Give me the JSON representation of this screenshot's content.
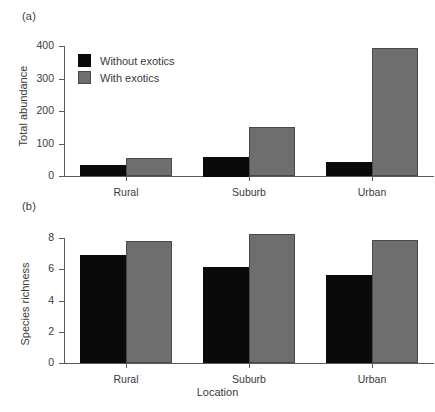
{
  "figure": {
    "panel_a_label": "(a)",
    "panel_b_label": "(b)"
  },
  "legend": {
    "position": "inside-top-left",
    "entries": [
      {
        "label": "Without exotics",
        "color": "#0a0a0a",
        "key": "without_exotics"
      },
      {
        "label": "With exotics",
        "color": "#6e6e6e",
        "key": "with_exotics"
      }
    ]
  },
  "chart_data": [
    {
      "id": "panel-a",
      "panel": "(a)",
      "type": "bar",
      "title": "",
      "xlabel": "",
      "ylabel": "Total abundance",
      "categories": [
        "Rural",
        "Suburb",
        "Urban"
      ],
      "series": [
        {
          "name": "Without exotics",
          "color": "#0a0a0a",
          "values": [
            35,
            60,
            42
          ]
        },
        {
          "name": "With exotics",
          "color": "#6e6e6e",
          "values": [
            55,
            150,
            395
          ]
        }
      ],
      "ylim": [
        0,
        400
      ],
      "yticks": [
        0,
        100,
        200,
        300,
        400
      ],
      "ytick_labels": [
        "0",
        "100",
        "200",
        "300",
        "400"
      ],
      "grid": false,
      "legend_position": "upper left"
    },
    {
      "id": "panel-b",
      "panel": "(b)",
      "type": "bar",
      "title": "",
      "xlabel": "Location",
      "ylabel": "Species richness",
      "categories": [
        "Rural",
        "Suburb",
        "Urban"
      ],
      "series": [
        {
          "name": "Without exotics",
          "color": "#0a0a0a",
          "values": [
            6.9,
            6.15,
            5.65
          ]
        },
        {
          "name": "With exotics",
          "color": "#6e6e6e",
          "values": [
            7.8,
            8.25,
            7.9
          ]
        }
      ],
      "ylim": [
        0,
        8
      ],
      "yticks": [
        0,
        2,
        4,
        6,
        8
      ],
      "ytick_labels": [
        "0",
        "2",
        "4",
        "6",
        "8"
      ],
      "grid": false,
      "legend_position": "none"
    }
  ]
}
